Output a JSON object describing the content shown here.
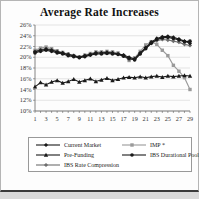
{
  "title": "Average Rate Increases",
  "chart_data": {
    "type": "line",
    "x": [
      1,
      2,
      3,
      4,
      5,
      6,
      7,
      8,
      9,
      10,
      11,
      12,
      13,
      14,
      15,
      16,
      17,
      18,
      19,
      20,
      21,
      22,
      23,
      24,
      25,
      26,
      27,
      28,
      29
    ],
    "x_tick_labels": [
      "1",
      "3",
      "5",
      "7",
      "9",
      "11",
      "13",
      "15",
      "17",
      "19",
      "21",
      "23",
      "25",
      "27",
      "29"
    ],
    "ylim": [
      10,
      26
    ],
    "y_tick_step": 2,
    "y_tick_labels": [
      "10%",
      "12%",
      "14%",
      "16%",
      "18%",
      "20%",
      "22%",
      "24%",
      "26%"
    ],
    "grid": true,
    "legend_position": "bottom",
    "series": [
      {
        "name": "IMP *",
        "marker": "square",
        "color": "#9a9a9a",
        "values": [
          21.3,
          21.7,
          21.9,
          21.6,
          21.2,
          20.9,
          20.6,
          20.3,
          20.1,
          20.4,
          20.7,
          21.0,
          21.0,
          21.1,
          21.0,
          20.8,
          20.3,
          19.4,
          19.9,
          21.1,
          22.3,
          22.9,
          22.4,
          21.3,
          20.3,
          18.5,
          17.4,
          16.2,
          14.0
        ]
      },
      {
        "name": "IBS Rate Compression",
        "marker": "diamond",
        "color": "#6e6e6e",
        "values": [
          21.1,
          21.4,
          21.6,
          21.4,
          21.1,
          20.8,
          20.6,
          20.2,
          20.0,
          20.2,
          20.6,
          20.8,
          20.8,
          20.9,
          20.8,
          20.7,
          20.3,
          19.6,
          19.6,
          20.7,
          21.7,
          22.6,
          23.1,
          23.3,
          23.2,
          23.0,
          22.8,
          22.4,
          22.2
        ]
      },
      {
        "name": "IBS Durational Pooling",
        "marker": "circle",
        "color": "#1a1a1a",
        "values": [
          20.8,
          21.1,
          21.3,
          21.1,
          20.8,
          20.6,
          20.3,
          20.1,
          19.9,
          20.1,
          20.4,
          20.6,
          20.6,
          20.7,
          20.6,
          20.5,
          20.2,
          19.8,
          19.5,
          20.6,
          21.6,
          22.6,
          23.3,
          23.6,
          23.7,
          23.5,
          23.2,
          22.9,
          23.0
        ]
      },
      {
        "name": "Current Market",
        "marker": "diamond",
        "color": "#1a1a1a",
        "values": [
          21.0,
          21.3,
          21.5,
          21.3,
          21.0,
          20.8,
          20.5,
          20.3,
          20.0,
          20.3,
          20.5,
          20.8,
          20.8,
          20.9,
          20.8,
          20.6,
          20.4,
          20.0,
          19.7,
          20.8,
          21.8,
          22.8,
          23.5,
          23.8,
          23.9,
          23.7,
          23.4,
          23.0,
          22.6
        ]
      },
      {
        "name": "Pre-Funding",
        "marker": "triangle",
        "color": "#1a1a1a",
        "values": [
          14.5,
          15.3,
          14.9,
          15.4,
          15.7,
          15.2,
          15.5,
          15.9,
          15.4,
          15.7,
          16.0,
          15.5,
          15.8,
          16.1,
          15.7,
          15.9,
          16.2,
          16.3,
          16.2,
          16.4,
          16.2,
          16.4,
          16.5,
          16.3,
          16.5,
          16.4,
          16.5,
          16.6,
          16.5
        ]
      }
    ],
    "legend_order": [
      "Current Market",
      "IMP *",
      "Pre-Funding",
      "IBS Durational Pooling",
      "IBS Rate Compression"
    ]
  }
}
